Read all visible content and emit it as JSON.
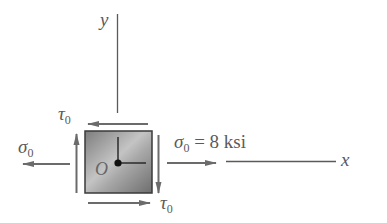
{
  "diagram": {
    "type": "stress-element",
    "axes": {
      "x_label": "x",
      "y_label": "y"
    },
    "origin_label": "O",
    "labels": {
      "tau_top": {
        "symbol": "τ",
        "subscript": "0"
      },
      "tau_bottom": {
        "symbol": "τ",
        "subscript": "0"
      },
      "sigma_left": {
        "symbol": "σ",
        "subscript": "0"
      },
      "sigma_right": {
        "symbol": "σ",
        "subscript": "0",
        "equation": " = 8 ksi"
      }
    },
    "colors": {
      "arrow": "#6b6b6b",
      "axis": "#5a5a5a",
      "element_fill": "#9a9a9a",
      "element_border": "#3a3a3a"
    }
  }
}
